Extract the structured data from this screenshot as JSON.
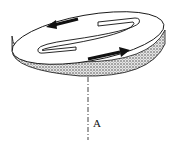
{
  "diagram": {
    "axis_label": "A",
    "colors": {
      "line": "#111111",
      "edge_fill": "#bdbdbd",
      "top_fill": "#ffffff"
    }
  }
}
